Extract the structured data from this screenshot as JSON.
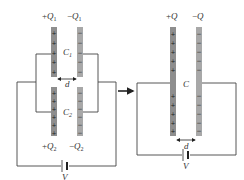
{
  "left_circuit": {
    "capacitor_top": {
      "name": "C",
      "subscript": "1",
      "charge_pos": "+Q",
      "charge_pos_sub": "1",
      "charge_neg": "−Q",
      "charge_neg_sub": "1",
      "gap_label": "d"
    },
    "capacitor_bottom": {
      "name": "C",
      "subscript": "2",
      "charge_pos": "+Q",
      "charge_pos_sub": "2",
      "charge_neg": "−Q",
      "charge_neg_sub": "2"
    },
    "battery_label": "V"
  },
  "right_circuit": {
    "capacitor": {
      "name": "C",
      "charge_pos": "+Q",
      "charge_neg": "−Q",
      "gap_label": "d"
    },
    "battery_label": "V"
  },
  "colors": {
    "positive_plate": "#8e8e8e",
    "negative_plate": "#a8a8a8",
    "wire": "#444444"
  },
  "signs": {
    "plus": "+",
    "minus": "−"
  }
}
